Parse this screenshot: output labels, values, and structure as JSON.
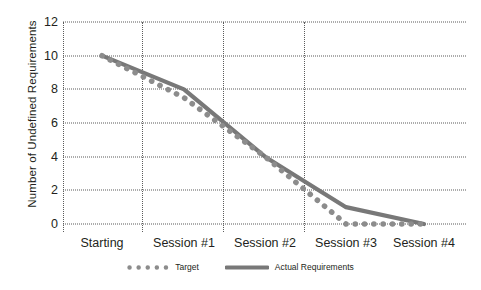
{
  "chart_data": {
    "type": "line",
    "title": "",
    "xlabel": "",
    "ylabel": "Number of Undefined Requirements",
    "categories": [
      "Starting",
      "Session #1",
      "Session #2",
      "Session #3",
      "Session #4"
    ],
    "ylim": [
      0,
      12
    ],
    "yticks": [
      0,
      2,
      4,
      6,
      8,
      10,
      12
    ],
    "ytick_labels": [
      "0",
      "2",
      "4",
      "6",
      "8",
      "10",
      "12"
    ],
    "grid": "horizontal-dotted-and-vertical-category-separators",
    "legend_position": "bottom-center",
    "series": [
      {
        "name": "Target",
        "style": "dotted",
        "color": "#8c8c8c",
        "values": [
          10,
          7.5,
          4,
          0,
          0
        ]
      },
      {
        "name": "Actual Requirements",
        "style": "solid",
        "color": "#787878",
        "values": [
          10,
          8,
          4,
          1,
          0
        ]
      }
    ],
    "series_colors": {
      "target": "#8c8c8c",
      "actual": "#787878"
    },
    "grid_color": "#5b5b5b",
    "background": "#ffffff",
    "text_color": "#231f20"
  },
  "legend": {
    "entries": [
      {
        "label": "Target",
        "marker": "dotted-line-marker"
      },
      {
        "label": "Actual Requirements",
        "marker": "solid-line-marker"
      }
    ]
  }
}
